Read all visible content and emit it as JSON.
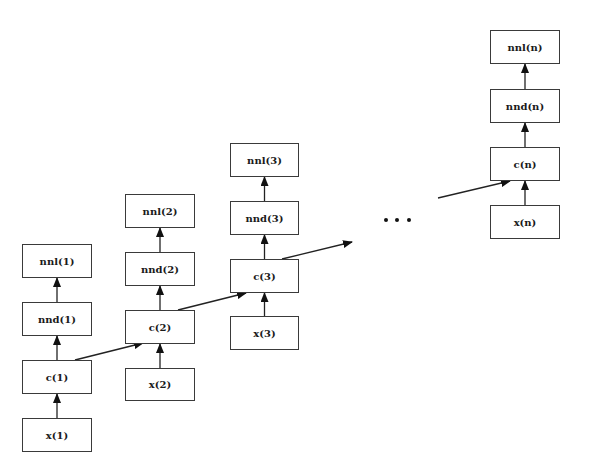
{
  "diagram": {
    "type": "unrolled-recurrent-network",
    "colors": {
      "stroke": "#3a3a3a",
      "text": "#1a1a1a",
      "background": "#ffffff"
    },
    "ellipsis": "...",
    "columns": [
      {
        "id": "1",
        "nodes": {
          "x": {
            "label": "x(1)",
            "x": 22,
            "y": 418,
            "w": 70,
            "h": 34
          },
          "c": {
            "label": "c(1)",
            "x": 22,
            "y": 360,
            "w": 70,
            "h": 34
          },
          "nnd": {
            "label": "nnd(1)",
            "x": 22,
            "y": 302,
            "w": 70,
            "h": 34
          },
          "nnl": {
            "label": "nnl(1)",
            "x": 22,
            "y": 244,
            "w": 70,
            "h": 34
          }
        }
      },
      {
        "id": "2",
        "nodes": {
          "x": {
            "label": "x(2)",
            "x": 125,
            "y": 368,
            "w": 70,
            "h": 33
          },
          "c": {
            "label": "c(2)",
            "x": 125,
            "y": 310,
            "w": 70,
            "h": 34
          },
          "nnd": {
            "label": "nnd(2)",
            "x": 125,
            "y": 252,
            "w": 70,
            "h": 34
          },
          "nnl": {
            "label": "nnl(2)",
            "x": 125,
            "y": 194,
            "w": 70,
            "h": 34
          }
        }
      },
      {
        "id": "3",
        "nodes": {
          "x": {
            "label": "x(3)",
            "x": 230,
            "y": 316,
            "w": 69,
            "h": 34
          },
          "c": {
            "label": "c(3)",
            "x": 230,
            "y": 259,
            "w": 69,
            "h": 34
          },
          "nnd": {
            "label": "nnd(3)",
            "x": 230,
            "y": 201,
            "w": 69,
            "h": 34
          },
          "nnl": {
            "label": "nnl(3)",
            "x": 230,
            "y": 143,
            "w": 69,
            "h": 34
          }
        }
      },
      {
        "id": "n",
        "nodes": {
          "x": {
            "label": "x(n)",
            "x": 490,
            "y": 205,
            "w": 70,
            "h": 34
          },
          "c": {
            "label": "c(n)",
            "x": 490,
            "y": 147,
            "w": 70,
            "h": 34
          },
          "nnd": {
            "label": "nnd(n)",
            "x": 490,
            "y": 89,
            "w": 70,
            "h": 34
          },
          "nnl": {
            "label": "nnl(n)",
            "x": 490,
            "y": 30,
            "w": 70,
            "h": 34
          }
        }
      }
    ],
    "recurrent_edges": [
      {
        "from": "c(1)",
        "to": "c(2)",
        "x1": 75,
        "y1": 360,
        "x2": 143,
        "y2": 343
      },
      {
        "from": "c(2)",
        "to": "c(3)",
        "x1": 178,
        "y1": 310,
        "x2": 246,
        "y2": 293
      },
      {
        "from": "c(3)",
        "to": "...",
        "x1": 282,
        "y1": 259,
        "x2": 352,
        "y2": 242
      },
      {
        "from": "...",
        "to": "c(n)",
        "x1": 438,
        "y1": 198,
        "x2": 510,
        "y2": 181
      }
    ],
    "ellipsis_dots": [
      {
        "x": 386,
        "y": 220
      },
      {
        "x": 397,
        "y": 220
      },
      {
        "x": 409,
        "y": 220
      }
    ]
  }
}
